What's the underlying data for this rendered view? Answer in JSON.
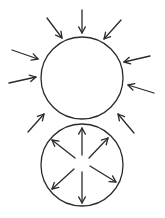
{
  "diagram": {
    "stroke_color": "#2a2a2a",
    "background_color": "#ffffff",
    "upper_circle": {
      "label": "",
      "arrow_direction": "inward",
      "arrow_count": 9
    },
    "lower_circle": {
      "label": "",
      "arrow_direction": "outward",
      "arrow_count": 6
    }
  }
}
